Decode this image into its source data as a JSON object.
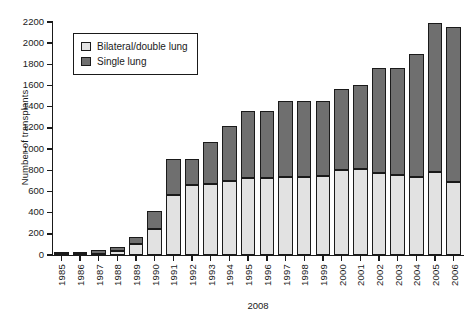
{
  "chart_data": {
    "type": "bar",
    "subtype": "stacked-vertical",
    "title": "",
    "xlabel": "2008",
    "ylabel": "Number of transplants",
    "ylim": [
      0,
      2200
    ],
    "ytick_step": 200,
    "yticks": [
      0,
      200,
      400,
      600,
      800,
      1000,
      1200,
      1400,
      1600,
      1800,
      2000,
      2200
    ],
    "grid": false,
    "legend_position": "top-left-inside",
    "categories": [
      "1985",
      "1986",
      "1987",
      "1988",
      "1989",
      "1990",
      "1991",
      "1992",
      "1993",
      "1994",
      "1995",
      "1996",
      "1997",
      "1998",
      "1999",
      "2000",
      "2001",
      "2002",
      "2003",
      "2004",
      "2005",
      "2006"
    ],
    "series": [
      {
        "name": "Bilateral/double lung",
        "color": "#e2e2e2",
        "values": [
          5,
          5,
          10,
          35,
          100,
          250,
          570,
          660,
          670,
          700,
          730,
          730,
          740,
          740,
          750,
          800,
          810,
          770,
          760,
          740,
          780,
          690
        ]
      },
      {
        "name": "Single lung",
        "color": "#6f6f6f",
        "values": [
          5,
          5,
          40,
          45,
          70,
          170,
          340,
          250,
          400,
          520,
          630,
          630,
          710,
          710,
          700,
          770,
          800,
          1000,
          1010,
          1160,
          1410,
          1460
        ]
      }
    ],
    "totals": [
      10,
      10,
      50,
      80,
      170,
      420,
      910,
      910,
      1070,
      1220,
      1360,
      1360,
      1450,
      1450,
      1450,
      1570,
      1610,
      1770,
      1770,
      1900,
      2190,
      2150
    ]
  },
  "legend": {
    "items": [
      {
        "label": "Bilateral/double lung",
        "swatch": "bilateral"
      },
      {
        "label": "Single lung",
        "swatch": "single"
      }
    ]
  },
  "axes": {
    "y_title": "Number of transplants",
    "x_title": "2008"
  }
}
